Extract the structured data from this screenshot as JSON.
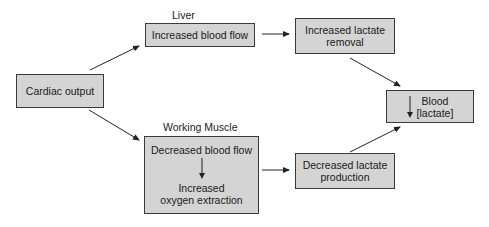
{
  "diagram": {
    "labels": {
      "liver": "Liver",
      "working_muscle": "Working Muscle"
    },
    "nodes": {
      "cardiac_output": "Cardiac output",
      "liver_blood_flow": "Increased blood flow",
      "lactate_removal_line1": "Increased lactate",
      "lactate_removal_line2": "removal",
      "muscle_blood_flow": "Decreased blood flow",
      "oxygen_extraction_line1": "Increased",
      "oxygen_extraction_line2": "oxygen extraction",
      "lactate_production_line1": "Decreased lactate",
      "lactate_production_line2": "production",
      "blood_line1": "Blood",
      "blood_line2": "[lactate]"
    },
    "edges": [
      {
        "from": "Cardiac output",
        "to": "Increased blood flow (Liver)"
      },
      {
        "from": "Cardiac output",
        "to": "Decreased blood flow (Working Muscle)"
      },
      {
        "from": "Increased blood flow (Liver)",
        "to": "Increased lactate removal"
      },
      {
        "from": "Decreased blood flow (Working Muscle)",
        "to": "Decreased lactate production"
      },
      {
        "from": "Increased lactate removal",
        "to": "Blood [lactate]"
      },
      {
        "from": "Decreased lactate production",
        "to": "Blood [lactate]"
      },
      {
        "from": "Decreased blood flow",
        "to": "Increased oxygen extraction"
      }
    ],
    "colors": {
      "box_fill": "#d4d4d4",
      "box_border": "#3a3a3a",
      "arrow": "#222222"
    }
  }
}
